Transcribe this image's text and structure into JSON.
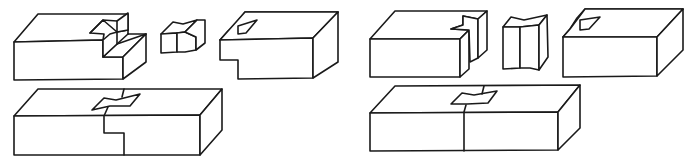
{
  "figure": {
    "line_color": "#1a1a1a",
    "background": "#ffffff",
    "panels": [
      {
        "id": "left",
        "label": "Horizontal butterfly key joint",
        "parts": [
          "block-with-notch",
          "butterfly-key-flat",
          "mating-block-with-notch",
          "assembled-joint"
        ]
      },
      {
        "id": "right",
        "label": "Vertical butterfly key joint",
        "parts": [
          "block-with-notch",
          "butterfly-key-tall",
          "mating-block-with-notch",
          "assembled-joint"
        ]
      }
    ],
    "caption": ""
  }
}
